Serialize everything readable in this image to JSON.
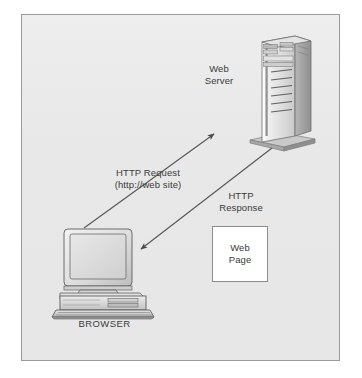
{
  "figure": {
    "background_color": "#e9e9e9",
    "border_color": "#9a9a9a",
    "page_color": "#ffffff"
  },
  "labels": {
    "web_server": "Web\nServer",
    "http_request": "HTTP Request\n(http://web site)",
    "http_response": "HTTP\nResponse",
    "web_page": "Web\nPage",
    "browser": "BROWSER"
  },
  "nodes": [
    {
      "id": "web-server",
      "label": "Web Server",
      "type": "server-tower",
      "x": 252,
      "y": 36,
      "width": 62,
      "height": 110
    },
    {
      "id": "browser",
      "label": "BROWSER",
      "type": "desktop-computer",
      "x": 58,
      "y": 228,
      "width": 96,
      "height": 86
    },
    {
      "id": "web-page",
      "label": "Web Page",
      "type": "document-box",
      "x": 212,
      "y": 226,
      "width": 56,
      "height": 56
    }
  ],
  "arrows": [
    {
      "id": "http-request-arrow",
      "label": "HTTP Request (http://web site)",
      "from": "browser",
      "to": "web-server",
      "x1": 84,
      "y1": 228,
      "x2": 216,
      "y2": 133,
      "color": "#555555"
    },
    {
      "id": "http-response-arrow",
      "label": "HTTP Response",
      "from": "web-server",
      "to": "browser",
      "x1": 272,
      "y1": 148,
      "x2": 139,
      "y2": 250,
      "color": "#555555"
    }
  ],
  "colors": {
    "arrow": "#555555",
    "text": "#3a3a3a",
    "device_light": "#dcdcdc",
    "device_mid": "#c4c4c4",
    "device_dark": "#9d9d9d",
    "device_outline": "#6e6e6e"
  }
}
